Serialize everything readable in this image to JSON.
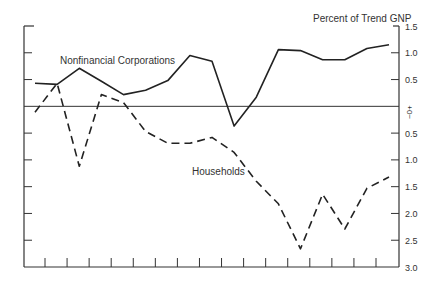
{
  "chart_data": {
    "type": "line",
    "title": "",
    "ylabel": "Percent of Trend GNP",
    "xlabel": "",
    "axis_note": "Positive values above zero line (+), negative values below (−)",
    "y_ticks": [
      "1.5",
      "1.0",
      "0.5",
      "0",
      "0.5",
      "1.0",
      "1.5",
      "2.0",
      "2.5",
      "3.0"
    ],
    "y_tick_values": [
      1.5,
      1.0,
      0.5,
      0,
      -0.5,
      -1.0,
      -1.5,
      -2.0,
      -2.5,
      -3.0
    ],
    "zero_label": "+\n0\n−",
    "ylim": [
      -3.0,
      1.5
    ],
    "grid": false,
    "x_tick_count": 16,
    "x_tick_labels": [],
    "x": [
      1,
      2,
      3,
      4,
      5,
      6,
      7,
      8,
      9,
      10,
      11,
      12,
      13,
      14,
      15,
      16,
      17
    ],
    "series": [
      {
        "name": "Nonfinancial Corporations",
        "style": "solid",
        "values": [
          0.43,
          0.41,
          0.71,
          0.47,
          0.22,
          0.3,
          0.48,
          0.95,
          0.84,
          -0.37,
          0.17,
          1.06,
          1.04,
          0.87,
          0.87,
          1.08,
          1.15
        ]
      },
      {
        "name": "Households",
        "style": "dashed",
        "values": [
          -0.11,
          0.43,
          -1.12,
          0.22,
          0.07,
          -0.47,
          -0.69,
          -0.69,
          -0.58,
          -0.86,
          -1.4,
          -1.82,
          -2.66,
          -1.64,
          -2.29,
          -1.53,
          -1.32
        ]
      }
    ],
    "annotations": [
      {
        "text": "Nonfinancial Corporations",
        "series": 0
      },
      {
        "text": "Households",
        "series": 1
      }
    ]
  },
  "labels": {
    "axis_title": "Percent of Trend GNP",
    "nfc": "Nonfinancial Corporations",
    "households": "Households"
  },
  "colors": {
    "line": "#222222",
    "axis": "#333333"
  }
}
